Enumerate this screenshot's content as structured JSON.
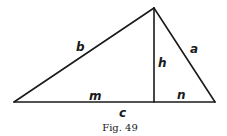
{
  "figure": {
    "caption": "Fig. 49",
    "colors": {
      "stroke": "#1a1a1a",
      "background": "#ffffff"
    },
    "vertices": {
      "left": [
        14,
        102
      ],
      "apex": [
        154,
        8
      ],
      "right": [
        215,
        102
      ],
      "foot": [
        154,
        102
      ]
    },
    "labels": {
      "b": "b",
      "a": "a",
      "h": "h",
      "m": "m",
      "n": "n",
      "c": "c"
    }
  }
}
